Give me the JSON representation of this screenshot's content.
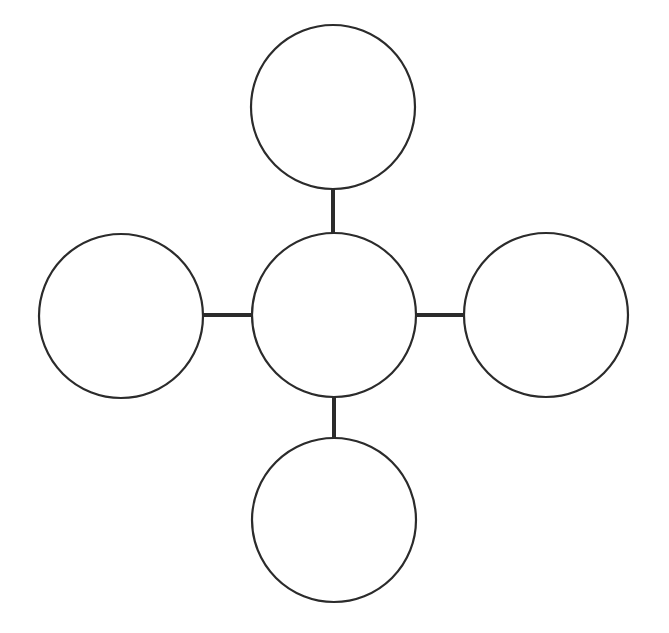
{
  "diagram": {
    "type": "concept-map / hub-and-spoke",
    "canvas": {
      "width": 669,
      "height": 633,
      "background": "#ffffff"
    },
    "stroke_color": "#2b2b2b",
    "node_stroke_width": 2.2,
    "connector_stroke_width": 4,
    "nodes": [
      {
        "id": "top",
        "label": "",
        "cx": 333,
        "cy": 107,
        "r": 82
      },
      {
        "id": "center",
        "label": "",
        "cx": 334,
        "cy": 315,
        "r": 82
      },
      {
        "id": "left",
        "label": "",
        "cx": 121,
        "cy": 316,
        "r": 82
      },
      {
        "id": "right",
        "label": "",
        "cx": 546,
        "cy": 315,
        "r": 82
      },
      {
        "id": "bottom",
        "label": "",
        "cx": 334,
        "cy": 520,
        "r": 82
      }
    ],
    "connectors": [
      {
        "from": "center",
        "to": "top",
        "x1": 333,
        "y1": 189,
        "x2": 333,
        "y2": 233
      },
      {
        "from": "center",
        "to": "left",
        "x1": 203,
        "y1": 315,
        "x2": 252,
        "y2": 315
      },
      {
        "from": "center",
        "to": "right",
        "x1": 416,
        "y1": 315,
        "x2": 464,
        "y2": 315
      },
      {
        "from": "center",
        "to": "bottom",
        "x1": 334,
        "y1": 397,
        "x2": 334,
        "y2": 438
      }
    ]
  }
}
